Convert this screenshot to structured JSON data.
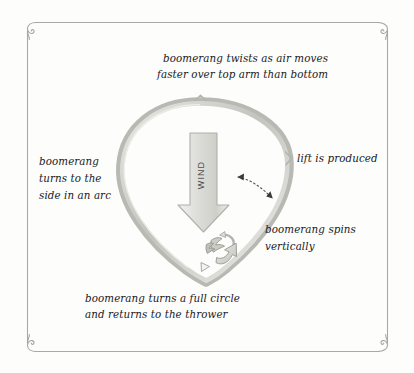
{
  "page": {
    "background_color": "#fdfdfb",
    "ink_color": "#20201e",
    "frame_color": "#a9a9a5",
    "band_color": "#c9c9c4",
    "arrow_fill": "#e4e4e0"
  },
  "frame": {
    "name": "decorative-border",
    "corner_ornament": "spiral-curl"
  },
  "labels": {
    "top": {
      "line1": "boomerang twists as air moves",
      "line2": "faster over top arm than bottom"
    },
    "left": {
      "line1": "boomerang",
      "line2": "turns to the",
      "line3": "side in an arc"
    },
    "right_upper": {
      "line1": "lift is produced"
    },
    "right_lower": {
      "line1": "boomerang spins",
      "line2": "vertically"
    },
    "bottom": {
      "line1": "boomerang turns a full circle",
      "line2": "and returns to the thrower"
    }
  },
  "wind_arrow": {
    "label": "WIND",
    "direction": "down"
  },
  "diagram": {
    "flight_path": "teardrop-loop",
    "boomerang_glyph": "boomerang-icon",
    "spin_arrow": "curved-spin-arrow",
    "lift_pointer": "dotted-double-arrow"
  }
}
